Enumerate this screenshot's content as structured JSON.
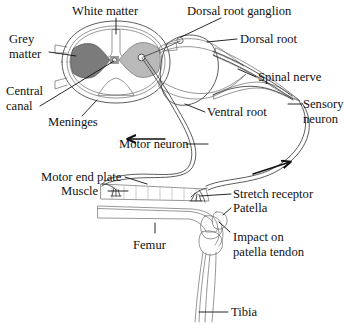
{
  "figure": {
    "labels": {
      "white_matter": "White matter",
      "grey_matter_line1": "Grey",
      "grey_matter_line2": "matter",
      "central_canal_line1": "Central",
      "central_canal_line2": "canal",
      "meninges": "Meninges",
      "dorsal_root_ganglion": "Dorsal root ganglion",
      "dorsal_root": "Dorsal root",
      "spinal_nerve": "Spinal nerve",
      "sensory_neuron_line1": "Sensory",
      "sensory_neuron_line2": "neuron",
      "ventral_root": "Ventral root",
      "motor_neuron": "Motor neuron",
      "motor_end_plate": "Motor end plate",
      "muscle": "Muscle",
      "stretch_receptor": "Stretch receptor",
      "patella": "Patella",
      "impact_line1": "Impact on",
      "impact_line2": "patella tendon",
      "femur": "Femur",
      "tibia": "Tibia"
    },
    "colors": {
      "background": "#ffffff",
      "text": "#111111",
      "grey_matter_dark": "#7b7b7b",
      "grey_matter_light": "#bdbdbd",
      "white_matter": "#ededed",
      "meninges": "#e4e4e4",
      "ganglion_fill": "#f2f2f2",
      "muscle": "#c9c9c9",
      "bone": "#e8e8e8",
      "nerve_stroke": "#3d3d3d",
      "outline_stroke": "#4a4a4a"
    },
    "icons": {
      "motor_arrow": "arrow-left-icon",
      "sensory_arrow": "arrow-right-icon"
    },
    "structures": [
      "spinal cord cross-section",
      "dorsal root ganglion",
      "dorsal root",
      "ventral root",
      "spinal nerve",
      "sensory neuron",
      "motor neuron",
      "motor end plate",
      "quadriceps muscle",
      "stretch receptor",
      "femur",
      "patella",
      "patella tendon",
      "tibia"
    ]
  }
}
